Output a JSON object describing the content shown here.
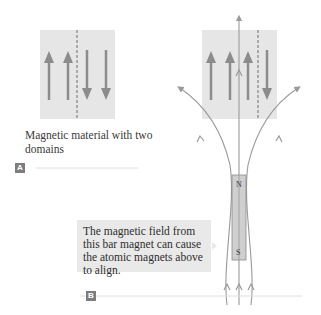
{
  "panel_a": {
    "tag": "A",
    "caption": "Magnetic material with two domains",
    "domains": [
      {
        "arrows": [
          "up",
          "up"
        ]
      },
      {
        "arrows": [
          "down",
          "down"
        ]
      }
    ]
  },
  "panel_b": {
    "tag": "B",
    "callout": "The magnetic field from this bar magnet can cause the atomic magnets above to align.",
    "domains": [
      {
        "arrows": [
          "up",
          "up",
          "up"
        ]
      },
      {
        "arrows": [
          "down"
        ]
      }
    ],
    "magnet": {
      "north_label": "N",
      "south_label": "S"
    }
  },
  "colors": {
    "box_fill": "#e6e6e6",
    "arrow": "#8c8c8c",
    "field_line": "#9a9a9a",
    "tag_fill": "#7d7d7d",
    "callout_fill": "#e9e9e9"
  }
}
